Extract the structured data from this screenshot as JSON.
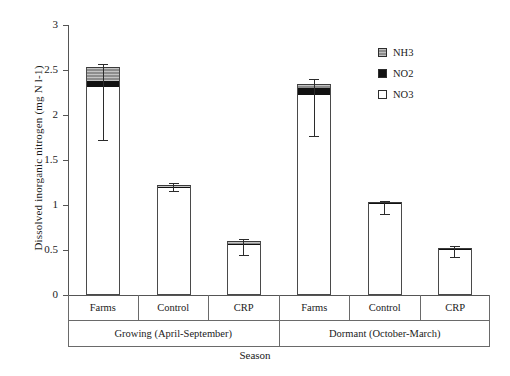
{
  "chart_data": {
    "type": "bar",
    "stacked": true,
    "title": "",
    "xlabel": "Season",
    "ylabel": "Dissolved inorganic nitrogen (mg N l-1)",
    "ylim": [
      0,
      3
    ],
    "ytick_labels": [
      "0",
      "0.5",
      "1",
      "1.5",
      "2",
      "2.5",
      "3"
    ],
    "ytick_values": [
      0,
      0.5,
      1,
      1.5,
      2,
      2.5,
      3
    ],
    "grid": false,
    "legend_position": "top-right",
    "categories": [
      "Farms",
      "Control",
      "CRP",
      "Farms",
      "Control",
      "CRP"
    ],
    "group_labels": [
      "Growing (April-September)",
      "Dormant (October-March)"
    ],
    "series": [
      {
        "name": "NO3",
        "color": "#ffffff",
        "values": [
          2.31,
          1.19,
          0.56,
          2.22,
          1.01,
          0.5
        ]
      },
      {
        "name": "NO2",
        "color": "#111111",
        "values": [
          0.07,
          0.01,
          0.01,
          0.08,
          0.01,
          0.01
        ]
      },
      {
        "name": "NH3",
        "color": "#8d8d8d",
        "values": [
          0.15,
          0.02,
          0.03,
          0.05,
          0.01,
          0.01
        ]
      }
    ],
    "totals": [
      2.53,
      1.22,
      0.6,
      2.35,
      1.03,
      0.52
    ],
    "error_bars": {
      "upper": [
        0.04,
        0.02,
        0.02,
        0.05,
        0.02,
        0.02
      ],
      "lower": [
        0.81,
        0.06,
        0.16,
        0.58,
        0.13,
        0.1
      ]
    }
  },
  "axis": {
    "y_label": "Dissolved inorganic nitrogen (mg N l-1)",
    "x_label": "Season",
    "y_ticks": [
      "3",
      "2.5",
      "2",
      "1.5",
      "1",
      "0.5",
      "0"
    ]
  },
  "legend": {
    "items": [
      {
        "label": "NH3",
        "swatch": "nh3-hatched-gray-swatch"
      },
      {
        "label": "NO2",
        "swatch": "no2-black-swatch"
      },
      {
        "label": "NO3",
        "swatch": "no3-white-swatch"
      }
    ]
  },
  "category_axis": {
    "row_treatments": [
      "Farms",
      "Control",
      "CRP",
      "Farms",
      "Control",
      "CRP"
    ],
    "row_seasons": [
      "Growing (April-September)",
      "Dormant (October-March)"
    ]
  }
}
